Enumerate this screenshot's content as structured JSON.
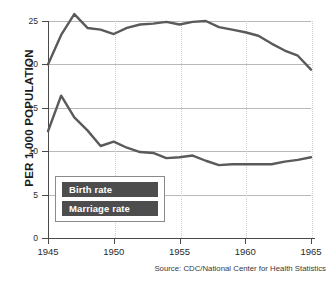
{
  "chart_data": {
    "type": "line",
    "title": "",
    "subtitle": "",
    "xlabel": "",
    "ylabel": "PER 1,000 POPULATION",
    "xlim": [
      1945,
      1965
    ],
    "ylim": [
      0,
      25
    ],
    "grid": "horizontal-solid-and-vertical-dotted",
    "legend_position": "inside-lower-left",
    "x": [
      1945,
      1946,
      1947,
      1948,
      1949,
      1950,
      1951,
      1952,
      1953,
      1954,
      1955,
      1956,
      1957,
      1958,
      1959,
      1960,
      1961,
      1962,
      1963,
      1964,
      1965
    ],
    "series": [
      {
        "name": "Birth rate",
        "color": "#5a5a5a",
        "values": [
          20.0,
          23.4,
          25.8,
          24.2,
          24.0,
          23.5,
          24.2,
          24.6,
          24.7,
          24.9,
          24.6,
          24.9,
          25.0,
          24.3,
          24.0,
          23.7,
          23.3,
          22.4,
          21.6,
          21.0,
          19.4
        ]
      },
      {
        "name": "Marriage rate",
        "color": "#5a5a5a",
        "values": [
          12.3,
          16.4,
          13.9,
          12.4,
          10.6,
          11.1,
          10.4,
          9.9,
          9.8,
          9.2,
          9.3,
          9.5,
          8.9,
          8.4,
          8.5,
          8.5,
          8.5,
          8.5,
          8.8,
          9.0,
          9.3
        ]
      }
    ],
    "y_ticks": [
      0,
      5,
      10,
      15,
      20,
      25
    ],
    "y_tick_labels": [
      "0",
      "5",
      "10",
      "15",
      "20",
      "25"
    ],
    "x_ticks": [
      1945,
      1950,
      1955,
      1960,
      1965
    ],
    "x_tick_labels": [
      "1945",
      "1950",
      "1955",
      "1960",
      "1965"
    ]
  },
  "legend": {
    "items": [
      {
        "label": "Birth rate"
      },
      {
        "label": "Marriage rate"
      }
    ]
  },
  "footer": {
    "source": "Source: CDC/National Center for Health Statistics"
  }
}
